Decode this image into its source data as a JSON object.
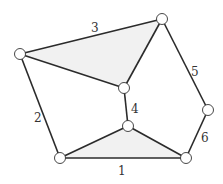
{
  "diagram": {
    "type": "graph",
    "colors": {
      "edge": "#2b2b2b",
      "face": "#f1f1f1",
      "node_fill": "#ffffff"
    },
    "nodes": [
      {
        "id": "A",
        "x": 20,
        "y": 54
      },
      {
        "id": "B",
        "x": 162,
        "y": 19
      },
      {
        "id": "C",
        "x": 124,
        "y": 88
      },
      {
        "id": "D",
        "x": 128,
        "y": 126
      },
      {
        "id": "E",
        "x": 208,
        "y": 110
      },
      {
        "id": "F",
        "x": 60,
        "y": 158
      },
      {
        "id": "G",
        "x": 186,
        "y": 158
      }
    ],
    "edges": [
      {
        "from": "A",
        "to": "B",
        "label": "3"
      },
      {
        "from": "A",
        "to": "C",
        "label": ""
      },
      {
        "from": "B",
        "to": "C",
        "label": ""
      },
      {
        "from": "C",
        "to": "D",
        "label": "4"
      },
      {
        "from": "B",
        "to": "E",
        "label": "5"
      },
      {
        "from": "E",
        "to": "G",
        "label": "6"
      },
      {
        "from": "A",
        "to": "F",
        "label": "2"
      },
      {
        "from": "F",
        "to": "G",
        "label": "1"
      },
      {
        "from": "F",
        "to": "D",
        "label": ""
      },
      {
        "from": "D",
        "to": "G",
        "label": ""
      }
    ],
    "shaded_faces": [
      [
        "A",
        "B",
        "C"
      ],
      [
        "F",
        "D",
        "G"
      ]
    ],
    "labels": {
      "e1": "1",
      "e2": "2",
      "e3": "3",
      "e4": "4",
      "e5": "5",
      "e6": "6"
    }
  }
}
